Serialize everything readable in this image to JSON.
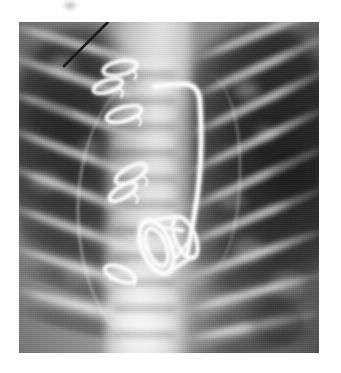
{
  "document": {
    "kind": "radiograph-figure",
    "modality": "X-ray",
    "view": "frontal-chest",
    "background_color": "#ffffff",
    "caption": ""
  },
  "plate": {
    "label": "chest-radiograph",
    "left": 19,
    "top": 22,
    "width": 300,
    "height": 331,
    "tone": {
      "film_base": "#8f8f8f",
      "lung_dark": "#3a3a3a",
      "mediastinum_bright": "#e8e8e8",
      "hardware_white": "#fbfbfb",
      "ink_black": "#1b1b1b"
    }
  },
  "anatomy": {
    "right_lung_label": "right-lung-field",
    "left_lung_label": "left-lung-field",
    "mediastinum_label": "mediastinum-spine-column",
    "cardiac_border_label": "cardiac-silhouette-border",
    "aortic_border_label": "aortic-mediastinal-border",
    "vertebrae": [
      {
        "y": 36
      },
      {
        "y": 62
      },
      {
        "y": 88
      },
      {
        "y": 114
      },
      {
        "y": 140
      },
      {
        "y": 166
      },
      {
        "y": 192
      },
      {
        "y": 218
      },
      {
        "y": 244
      },
      {
        "y": 270
      },
      {
        "y": 296
      }
    ],
    "ribs_right": [
      {
        "x": -16,
        "y": 18,
        "w": 150,
        "rot": 16
      },
      {
        "x": -18,
        "y": 52,
        "w": 152,
        "rot": 18
      },
      {
        "x": -20,
        "y": 88,
        "w": 150,
        "rot": 19
      },
      {
        "x": -20,
        "y": 126,
        "w": 148,
        "rot": 20
      },
      {
        "x": -18,
        "y": 164,
        "w": 146,
        "rot": 20
      },
      {
        "x": -16,
        "y": 202,
        "w": 142,
        "rot": 19
      },
      {
        "x": -12,
        "y": 240,
        "w": 136,
        "rot": 17
      },
      {
        "x": -8,
        "y": 278,
        "w": 128,
        "rot": 14
      }
    ],
    "ribs_left": [
      {
        "x": 168,
        "y": 6,
        "w": 150,
        "rot": -22
      },
      {
        "x": 164,
        "y": 40,
        "w": 156,
        "rot": -24
      },
      {
        "x": 160,
        "y": 76,
        "w": 160,
        "rot": -25
      },
      {
        "x": 158,
        "y": 114,
        "w": 160,
        "rot": -25
      },
      {
        "x": 158,
        "y": 152,
        "w": 158,
        "rot": -24
      },
      {
        "x": 158,
        "y": 190,
        "w": 156,
        "rot": -22
      },
      {
        "x": 160,
        "y": 228,
        "w": 152,
        "rot": -19
      },
      {
        "x": 162,
        "y": 266,
        "w": 146,
        "rot": -15
      },
      {
        "x": 164,
        "y": 300,
        "w": 140,
        "rot": -11
      }
    ],
    "mottle": [
      {
        "x": 30,
        "y": 34,
        "w": 26,
        "h": 18,
        "c": "rgba(255,255,255,0.30)"
      },
      {
        "x": 60,
        "y": 118,
        "w": 22,
        "h": 14,
        "c": "rgba(255,255,255,0.24)"
      },
      {
        "x": 12,
        "y": 150,
        "w": 30,
        "h": 20,
        "c": "rgba(255,255,255,0.22)"
      },
      {
        "x": 216,
        "y": 60,
        "w": 24,
        "h": 16,
        "c": "rgba(255,255,255,0.32)"
      },
      {
        "x": 236,
        "y": 104,
        "w": 20,
        "h": 14,
        "c": "rgba(255,255,255,0.26)"
      },
      {
        "x": 200,
        "y": 170,
        "w": 26,
        "h": 18,
        "c": "rgba(255,255,255,0.24)"
      },
      {
        "x": 214,
        "y": 216,
        "w": 30,
        "h": 22,
        "c": "rgba(255,255,255,0.26)"
      },
      {
        "x": 252,
        "y": 250,
        "w": 34,
        "h": 26,
        "c": "rgba(255,255,255,0.20)"
      },
      {
        "x": 44,
        "y": 240,
        "w": 30,
        "h": 24,
        "c": "rgba(255,255,255,0.18)"
      },
      {
        "x": 230,
        "y": 278,
        "w": 56,
        "h": 44,
        "c": "rgba(30,30,30,0.34)"
      },
      {
        "x": 10,
        "y": 74,
        "w": 44,
        "h": 40,
        "c": "rgba(30,30,30,0.26)"
      },
      {
        "x": 250,
        "y": 130,
        "w": 48,
        "h": 52,
        "c": "rgba(20,20,20,0.30)"
      }
    ]
  },
  "hardware": {
    "prosthetic_valve": {
      "label": "prosthetic-heart-valve-cage",
      "center_x": 145,
      "center_y": 222,
      "ring_rx": 22,
      "ring_ry": 28,
      "tilt_deg": -22
    },
    "catheter": {
      "label": "catheter-line-with-hooked-tip",
      "path": "M 136 64 L 164 62 Q 180 62 181 80 L 182 104 Q 183 140 178 176 Q 173 208 168 232"
    },
    "sternal_wires": [
      {
        "label": "sternal-wire-1",
        "cx": 101,
        "cy": 46,
        "rx": 17,
        "ry": 7,
        "rot": -12
      },
      {
        "label": "sternal-wire-2",
        "cx": 89,
        "cy": 64,
        "rx": 15,
        "ry": 6,
        "rot": -18
      },
      {
        "label": "sternal-wire-3",
        "cx": 105,
        "cy": 92,
        "rx": 18,
        "ry": 7,
        "rot": -16
      },
      {
        "label": "sternal-wire-4",
        "cx": 112,
        "cy": 152,
        "rx": 17,
        "ry": 7,
        "rot": -28
      },
      {
        "label": "sternal-wire-5",
        "cx": 104,
        "cy": 170,
        "rx": 15,
        "ry": 6,
        "rot": -30
      },
      {
        "label": "sternal-wire-6",
        "cx": 101,
        "cy": 252,
        "rx": 16,
        "ry": 7,
        "rot": 22
      }
    ]
  },
  "annotation": {
    "marker_line": {
      "label": "ink-pointer-line",
      "x1": 89,
      "y1": 0,
      "x2": 45,
      "y2": 44,
      "color": "#1b1b1b",
      "width": 2.6
    },
    "smudge": {
      "label": "ink-smudge",
      "x": 50,
      "y": -20,
      "w": 10,
      "h": 6
    }
  }
}
